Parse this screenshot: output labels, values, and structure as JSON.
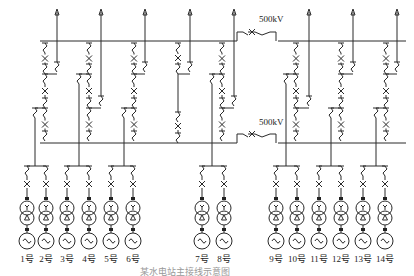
{
  "diagram": {
    "caption": "某水电站主接线示意图",
    "voltage_top": "500kV",
    "voltage_bottom": "500kV",
    "bus_top_name": "500kV I母",
    "bus_bottom_name": "500kV II母",
    "strings": 8,
    "outgoing_lines": 8,
    "units": [
      {
        "id": "1",
        "label": "1号"
      },
      {
        "id": "2",
        "label": "2号"
      },
      {
        "id": "3",
        "label": "3号"
      },
      {
        "id": "4",
        "label": "4号"
      },
      {
        "id": "5",
        "label": "5号"
      },
      {
        "id": "6",
        "label": "6号"
      },
      {
        "id": "7",
        "label": "7号"
      },
      {
        "id": "8",
        "label": "8号"
      },
      {
        "id": "9",
        "label": "9号"
      },
      {
        "id": "10",
        "label": "10号"
      },
      {
        "id": "11",
        "label": "11号"
      },
      {
        "id": "12",
        "label": "12号"
      },
      {
        "id": "13",
        "label": "13号"
      },
      {
        "id": "14",
        "label": "14号"
      }
    ],
    "symbols": {
      "breaker": "breaker-x-icon",
      "disconnector": "disconnector-icon",
      "transformer": "transformer-yd-icon",
      "generator": "generator-icon",
      "line": "outgoing-line-arrow-icon"
    }
  }
}
